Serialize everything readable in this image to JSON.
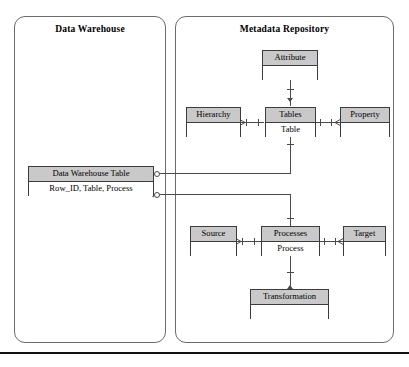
{
  "diagram": {
    "panels": [
      {
        "id": "data-warehouse",
        "title": "Data Warehouse"
      },
      {
        "id": "metadata-repository",
        "title": "Metadata Repository"
      }
    ],
    "entities": [
      {
        "id": "data-warehouse-table",
        "header": "Data Warehouse Table",
        "body": "Row_ID, Table, Process"
      },
      {
        "id": "attribute",
        "header": "Attribute",
        "body": ""
      },
      {
        "id": "hierarchy",
        "header": "Hierarchy",
        "body": ""
      },
      {
        "id": "tables",
        "header": "Tables",
        "body": "Table"
      },
      {
        "id": "property",
        "header": "Property",
        "body": ""
      },
      {
        "id": "source",
        "header": "Source",
        "body": ""
      },
      {
        "id": "processes",
        "header": "Processes",
        "body": "Process"
      },
      {
        "id": "target",
        "header": "Target",
        "body": ""
      },
      {
        "id": "transformation",
        "header": "Transformation",
        "body": ""
      }
    ],
    "colors": {
      "header_fill": "#c9c9c9",
      "body_fill": "#ffffff",
      "box_stroke": "#3c3c3c",
      "panel_stroke": "#6b6b6b",
      "connector": "#4a4a4a",
      "rule": "#111111",
      "background": "#ffffff"
    },
    "relationships": [
      {
        "from": "attribute",
        "to": "tables",
        "marker": "arrow-down"
      },
      {
        "from": "hierarchy",
        "to": "tables",
        "marker": "crows-foot"
      },
      {
        "from": "property",
        "to": "tables",
        "marker": "crows-foot"
      },
      {
        "from": "tables",
        "to": "processes-branch",
        "marker": "tick"
      },
      {
        "from": "source",
        "to": "processes",
        "marker": "crows-foot"
      },
      {
        "from": "target",
        "to": "processes",
        "marker": "crows-foot"
      },
      {
        "from": "transformation",
        "to": "processes",
        "marker": "arrow-up"
      },
      {
        "from": "data-warehouse-table",
        "to": "tables",
        "marker": "ring"
      },
      {
        "from": "data-warehouse-table",
        "to": "processes",
        "marker": "ring"
      }
    ]
  }
}
